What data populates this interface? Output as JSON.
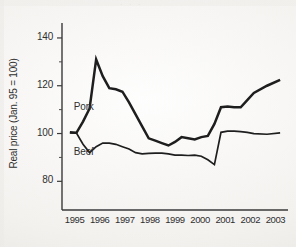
{
  "figure": {
    "background_color": "#f7f6f4",
    "ink_color": "#1e1e1e",
    "cropped_caption_top": "· · ·"
  },
  "chart_data": {
    "type": "line",
    "title": "",
    "subtitle": "",
    "xlabel": "",
    "ylabel": "Real price (Jan. 95 = 100)",
    "x": [
      1995,
      1996,
      1997,
      1998,
      1999,
      2000,
      2001,
      2002,
      2003
    ],
    "xlim": [
      1994.7,
      2003.3
    ],
    "ylim": [
      68,
      145
    ],
    "ytick_labels": [
      "140",
      "120",
      "100",
      "80"
    ],
    "ytick_values": [
      140,
      120,
      100,
      80
    ],
    "yticks_minor": [
      130,
      110,
      90
    ],
    "xtick_labels": [
      "1995",
      "1996",
      "1997",
      "1998",
      "1999",
      "2000",
      "2001",
      "2002",
      "2003"
    ],
    "grid": false,
    "legend": "inline-labels",
    "legend_position": "on-plot-left",
    "annotations": [
      {
        "text": "Pork",
        "x": 1995.15,
        "y": 110.5
      },
      {
        "text": "Beef",
        "x": 1995.15,
        "y": 92.0
      }
    ],
    "series": [
      {
        "name": "Pork",
        "label": "Pork",
        "color": "#1e1e1e",
        "line_width": 2.5,
        "x": [
          1995.0,
          1995.25,
          1995.5,
          1995.75,
          1996.0,
          1996.25,
          1996.5,
          1996.75,
          1997.0,
          1997.25,
          1997.5,
          1997.75,
          1998.0,
          1998.25,
          1998.5,
          1998.75,
          1999.0,
          1999.25,
          1999.5,
          1999.75,
          2000.0,
          2000.25,
          2000.5,
          2000.75,
          2001.0,
          2001.25,
          2001.5,
          2001.75,
          2002.0,
          2002.5,
          2003.0
        ],
        "values": [
          100.5,
          100.3,
          105.0,
          110.5,
          131.0,
          124.0,
          119.0,
          118.5,
          117.5,
          113.0,
          108.0,
          103.0,
          98.0,
          97.0,
          96.0,
          95.0,
          96.5,
          98.5,
          98.0,
          97.5,
          98.5,
          99.0,
          104.0,
          111.0,
          111.3,
          111.0,
          111.0,
          114.0,
          117.0,
          120.0,
          122.5
        ]
      },
      {
        "name": "Beef",
        "label": "Beef",
        "color": "#3a3a3a",
        "line_width": 1.7,
        "x": [
          1995.0,
          1995.25,
          1995.5,
          1995.75,
          1996.0,
          1996.25,
          1996.5,
          1996.75,
          1997.0,
          1997.25,
          1997.5,
          1997.75,
          1998.0,
          1998.25,
          1998.5,
          1998.75,
          1999.0,
          1999.25,
          1999.5,
          1999.75,
          2000.0,
          2000.25,
          2000.5,
          2000.75,
          2001.0,
          2001.25,
          2001.5,
          2001.75,
          2002.0,
          2002.5,
          2003.0
        ],
        "values": [
          100.3,
          100.2,
          95.5,
          92.0,
          94.5,
          96.0,
          96.0,
          95.5,
          94.5,
          93.5,
          92.0,
          91.5,
          91.7,
          91.8,
          91.8,
          91.5,
          91.0,
          91.0,
          90.8,
          91.0,
          90.5,
          89.0,
          87.0,
          100.5,
          101.0,
          101.0,
          100.8,
          100.5,
          100.0,
          99.7,
          100.3
        ]
      }
    ]
  }
}
